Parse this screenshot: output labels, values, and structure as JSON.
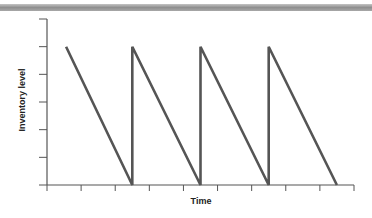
{
  "chart_data": {
    "type": "line",
    "title": "",
    "xlabel": "Time",
    "ylabel": "Inventory level",
    "grid": false,
    "legend": null,
    "x_ticks": 10,
    "y_ticks": 7,
    "xlim": [
      0,
      9
    ],
    "ylim": [
      0,
      6
    ],
    "series": [
      {
        "name": "Inventory level",
        "color": "#555555",
        "x": [
          0.56,
          2.5,
          2.5,
          4.5,
          4.5,
          6.5,
          6.5,
          8.5
        ],
        "y": [
          5,
          0,
          5,
          0,
          5,
          0,
          5,
          0
        ]
      }
    ],
    "annotations": []
  },
  "colors": {
    "line": "#555555",
    "axis": "#555555",
    "top_bar": "#9a9a9a"
  }
}
